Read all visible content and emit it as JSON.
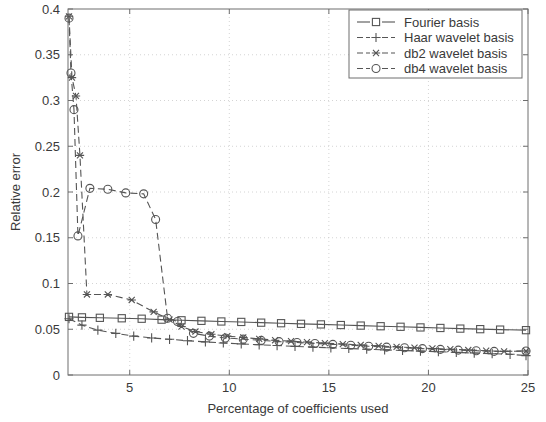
{
  "chart_data": {
    "type": "line",
    "title": "",
    "xlabel": "Percentage of coefficients used",
    "ylabel": "Relative error",
    "xlim": [
      1.9,
      25
    ],
    "ylim": [
      0,
      0.4
    ],
    "xticks": [
      5,
      10,
      15,
      20,
      25
    ],
    "xtick_labels": [
      "5",
      "10",
      "15",
      "20",
      "25"
    ],
    "yticks": [
      0,
      0.05,
      0.1,
      0.15,
      0.2,
      0.25,
      0.3,
      0.35,
      0.4
    ],
    "ytick_labels": [
      "0",
      "0.05",
      "0.1",
      "0.15",
      "0.2",
      "0.25",
      "0.3",
      "0.35",
      "0.4"
    ],
    "grid": true,
    "legend_position": "upper right",
    "series": [
      {
        "name": "Fourier basis",
        "marker": "square",
        "linestyle": "solid",
        "color": "#555555",
        "x": [
          1.95,
          2.6,
          3.5,
          4.6,
          5.6,
          6.6,
          7.6,
          8.6,
          9.6,
          10.6,
          11.6,
          12.6,
          13.6,
          14.6,
          15.6,
          16.6,
          17.6,
          18.6,
          19.6,
          20.6,
          21.6,
          22.6,
          23.6,
          24.9
        ],
        "y": [
          0.0635,
          0.063,
          0.0625,
          0.062,
          0.0615,
          0.0605,
          0.0598,
          0.0592,
          0.0585,
          0.058,
          0.0572,
          0.0566,
          0.0559,
          0.0553,
          0.0546,
          0.054,
          0.0533,
          0.0527,
          0.052,
          0.0514,
          0.0507,
          0.0501,
          0.0496,
          0.049
        ]
      },
      {
        "name": "Haar wavelet basis",
        "marker": "plus",
        "linestyle": "dashed",
        "color": "#555555",
        "x": [
          1.95,
          2.6,
          3.4,
          4.3,
          5.2,
          6.1,
          7.0,
          7.9,
          8.8,
          9.7,
          10.6,
          11.5,
          12.4,
          13.3,
          14.2,
          15.1,
          16.0,
          16.9,
          17.8,
          18.7,
          19.6,
          20.5,
          21.4,
          22.3,
          23.2,
          24.1,
          24.9
        ],
        "y": [
          0.0615,
          0.0545,
          0.049,
          0.0455,
          0.0425,
          0.0405,
          0.039,
          0.0375,
          0.0362,
          0.035,
          0.034,
          0.033,
          0.0322,
          0.0313,
          0.0305,
          0.0297,
          0.029,
          0.0282,
          0.0275,
          0.0268,
          0.0261,
          0.0254,
          0.0247,
          0.024,
          0.0233,
          0.0226,
          0.0212
        ]
      },
      {
        "name": "db2 wavelet basis",
        "marker": "asterisk",
        "linestyle": "dashed",
        "color": "#555555",
        "x": [
          1.95,
          2.1,
          2.3,
          2.5,
          2.85,
          3.9,
          5.1,
          6.2,
          7.0,
          7.6,
          8.3,
          9.1,
          9.9,
          10.7,
          11.5,
          12.3,
          13.1,
          13.9,
          14.8,
          15.7,
          16.6,
          17.5,
          18.4,
          19.3,
          20.2,
          21.1,
          22.0,
          22.9,
          23.8,
          24.9
        ],
        "y": [
          0.392,
          0.325,
          0.305,
          0.24,
          0.088,
          0.088,
          0.082,
          0.069,
          0.0605,
          0.053,
          0.0475,
          0.0445,
          0.0425,
          0.041,
          0.0395,
          0.038,
          0.037,
          0.036,
          0.0348,
          0.0338,
          0.0328,
          0.0318,
          0.0308,
          0.0298,
          0.029,
          0.0282,
          0.0273,
          0.0265,
          0.0258,
          0.0262
        ]
      },
      {
        "name": "db4 wavelet basis",
        "marker": "circle",
        "linestyle": "dashed",
        "color": "#555555",
        "x": [
          1.95,
          2.05,
          2.2,
          2.4,
          3.0,
          3.9,
          4.8,
          5.7,
          6.3,
          6.9,
          7.4,
          8.2,
          9.0,
          9.8,
          10.7,
          11.6,
          12.5,
          13.4,
          14.3,
          15.2,
          16.1,
          17.0,
          17.9,
          18.8,
          19.7,
          20.6,
          21.5,
          22.4,
          23.3,
          24.9
        ],
        "y": [
          0.39,
          0.33,
          0.29,
          0.152,
          0.204,
          0.203,
          0.199,
          0.198,
          0.17,
          0.062,
          0.0585,
          0.0455,
          0.0425,
          0.0405,
          0.0392,
          0.0378,
          0.0365,
          0.0355,
          0.0345,
          0.0335,
          0.0325,
          0.0315,
          0.0305,
          0.0297,
          0.0288,
          0.028,
          0.0272,
          0.0265,
          0.0258,
          0.0262
        ]
      }
    ],
    "legend": [
      {
        "label": "Fourier basis",
        "marker": "square",
        "linestyle": "solid"
      },
      {
        "label": "Haar wavelet basis",
        "marker": "plus",
        "linestyle": "dashed"
      },
      {
        "label": "db2 wavelet basis",
        "marker": "asterisk",
        "linestyle": "dashed"
      },
      {
        "label": "db4 wavelet basis",
        "marker": "circle",
        "linestyle": "dashed"
      }
    ]
  }
}
